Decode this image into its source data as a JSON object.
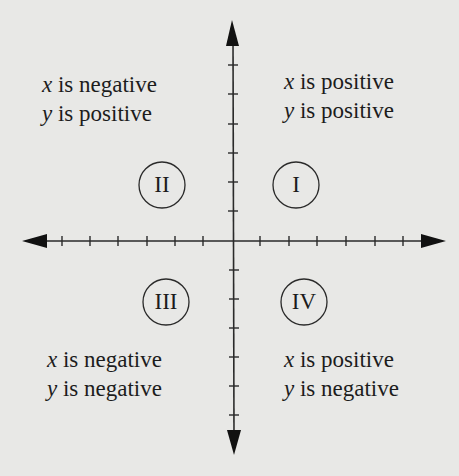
{
  "diagram": {
    "colors": {
      "background": "#e8e8e6",
      "ink": "#1c1c1c"
    },
    "axes": {
      "x_ticks_each_side": 6,
      "y_ticks_each_side": 6,
      "arrows": [
        "left",
        "right",
        "up",
        "down"
      ]
    },
    "quadrants": [
      {
        "id": "I",
        "numeral": "I",
        "x_var": "x",
        "x_text": " is positive",
        "y_var": "y",
        "y_text": " is positive"
      },
      {
        "id": "II",
        "numeral": "II",
        "x_var": "x",
        "x_text": " is negative",
        "y_var": "y",
        "y_text": " is positive"
      },
      {
        "id": "III",
        "numeral": "III",
        "x_var": "x",
        "x_text": " is negative",
        "y_var": "y",
        "y_text": " is negative"
      },
      {
        "id": "IV",
        "numeral": "IV",
        "x_var": "x",
        "x_text": " is positive",
        "y_var": "y",
        "y_text": " is negative"
      }
    ]
  }
}
